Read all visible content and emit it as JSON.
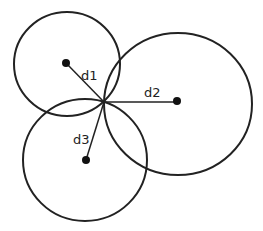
{
  "diagram": {
    "type": "trilateration",
    "stroke_color": "#222222",
    "background": "#ffffff",
    "intersection_point": {
      "x": 104,
      "y": 102
    },
    "circles": [
      {
        "id": "c1",
        "cx": 67,
        "cy": 64,
        "rx": 53,
        "ry": 52
      },
      {
        "id": "c2",
        "cx": 178,
        "cy": 104,
        "rx": 74,
        "ry": 71
      },
      {
        "id": "c3",
        "cx": 85,
        "cy": 160,
        "rx": 62,
        "ry": 61
      }
    ],
    "centers": [
      {
        "id": "p1",
        "x": 66,
        "y": 63
      },
      {
        "id": "p2",
        "x": 177,
        "y": 101
      },
      {
        "id": "p3",
        "x": 86,
        "y": 160
      }
    ],
    "distances": [
      {
        "label": "d1",
        "x": 81,
        "y": 80
      },
      {
        "label": "d2",
        "x": 144,
        "y": 96
      },
      {
        "label": "d3",
        "x": 73,
        "y": 143
      }
    ]
  }
}
